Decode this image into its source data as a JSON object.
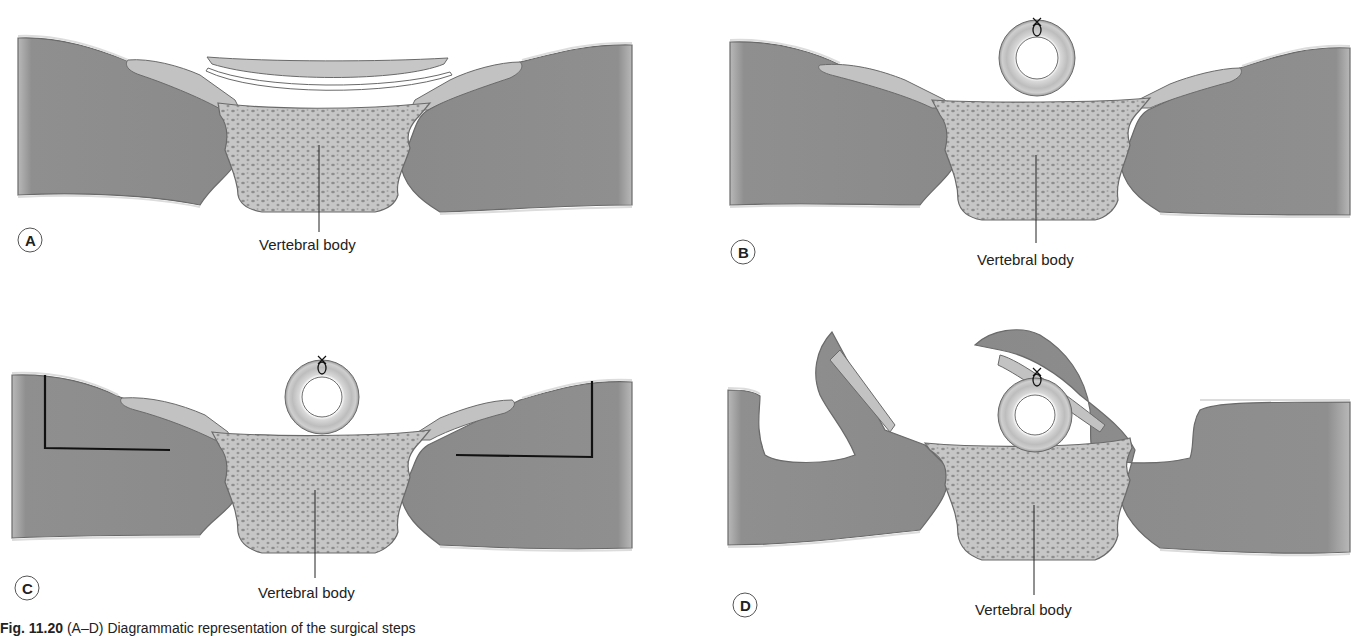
{
  "figure": {
    "caption_prefix": "Fig. 11.20",
    "caption_text": "(A–D) Diagrammatic representation of the surgical steps",
    "colors": {
      "muscle": "#8e8e8e",
      "muscle_edge": "#6a6a6a",
      "bone": "#c4c4c4",
      "bone_pore": "#8a8a8a",
      "ligament": "#bdbdbd",
      "skin_line": "#f0f0f0",
      "ink": "#111111"
    }
  },
  "panels": [
    {
      "letter": "A",
      "label": "Vertebral body",
      "state": "flat-ligament-above-body"
    },
    {
      "letter": "B",
      "label": "Vertebral body",
      "state": "tube-ligated-above-body"
    },
    {
      "letter": "C",
      "label": "Vertebral body",
      "state": "incision-lines-marked"
    },
    {
      "letter": "D",
      "label": "Vertebral body",
      "state": "muscle-flaps-raised"
    }
  ]
}
